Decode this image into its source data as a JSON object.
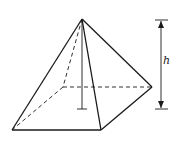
{
  "figure": {
    "label_height": "h",
    "colors": {
      "stroke": "#1a1a1a",
      "background": "#ffffff"
    },
    "vertices": {
      "apex": [
        82,
        19
      ],
      "front_left": [
        12,
        130
      ],
      "front_right": [
        101,
        130
      ],
      "back_right": [
        152,
        87
      ],
      "back_left": [
        63,
        87
      ],
      "base_center": [
        82,
        109
      ]
    },
    "dimension": {
      "x": 161,
      "top_y": 20,
      "bottom_y": 109
    }
  }
}
